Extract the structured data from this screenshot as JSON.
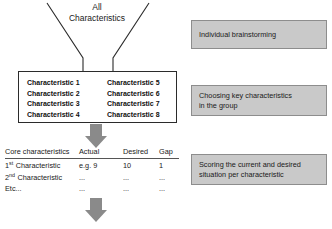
{
  "diagram": {
    "funnel": {
      "title_line1": "All",
      "title_line2": "Characteristics"
    },
    "characteristics_box": {
      "left_column": [
        "Characteristic 1",
        "Characteristic 2",
        "Characteristic 3",
        "Characteristic 4"
      ],
      "right_column": [
        "Characteristic 5",
        "Characteristic 6",
        "Characteristic 7",
        "Characteristic 8"
      ]
    },
    "scoring_table": {
      "headers": [
        "Core characteristics",
        "Actual",
        "Desired",
        "Gap"
      ],
      "rows": [
        {
          "ordinal": "1",
          "ordinal_suffix": "st",
          "name": "Characteristic",
          "actual": "e.g. 9",
          "desired": "10",
          "gap": "1"
        },
        {
          "ordinal": "2",
          "ordinal_suffix": "nd",
          "name": "Characteristic",
          "actual": "...",
          "desired": "...",
          "gap": "..."
        },
        {
          "ordinal": "",
          "ordinal_suffix": "",
          "name": "Etc...",
          "actual": "...",
          "desired": "...",
          "gap": "..."
        }
      ]
    },
    "notes": [
      {
        "line1": "Individual brainstorming",
        "line2": ""
      },
      {
        "line1": "Choosing key characteristics",
        "line2": "in the group"
      },
      {
        "line1": "Scoring the current and desired",
        "line2": "situation per characteristic"
      }
    ],
    "arrows": [
      {
        "label": "down-arrow-to-table"
      },
      {
        "label": "down-arrow-to-next-step"
      }
    ],
    "colors": {
      "note_fill": "#c9c9c9",
      "note_border": "#8d8d8d",
      "arrow_fill": "#8a8a8a",
      "line": "#2b2b2b"
    }
  }
}
